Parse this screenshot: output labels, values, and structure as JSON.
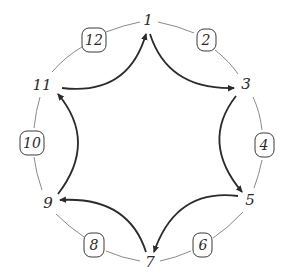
{
  "diagram": {
    "title": "",
    "colors": {
      "circle": "#8a8a8a",
      "arrow": "#2b2b2b",
      "text": "#2a2a2a"
    },
    "odd_nodes": [
      {
        "id": "1",
        "label": "1",
        "x": 148,
        "y": 20
      },
      {
        "id": "3",
        "label": "3",
        "x": 246,
        "y": 84
      },
      {
        "id": "5",
        "label": "5",
        "x": 250,
        "y": 200
      },
      {
        "id": "7",
        "label": "7",
        "x": 150,
        "y": 262
      },
      {
        "id": "9",
        "label": "9",
        "x": 48,
        "y": 203
      },
      {
        "id": "11",
        "label": "11",
        "x": 42,
        "y": 85
      }
    ],
    "boxed_nodes": [
      {
        "id": "2",
        "label": "2",
        "x": 206,
        "y": 40
      },
      {
        "id": "4",
        "label": "4",
        "x": 264,
        "y": 145
      },
      {
        "id": "6",
        "label": "6",
        "x": 203,
        "y": 245
      },
      {
        "id": "8",
        "label": "8",
        "x": 94,
        "y": 245
      },
      {
        "id": "10",
        "label": "10",
        "x": 32,
        "y": 143
      },
      {
        "id": "12",
        "label": "12",
        "x": 94,
        "y": 40
      }
    ],
    "arrows": [
      {
        "from": "11",
        "to": "1"
      },
      {
        "from": "1",
        "to": "3"
      },
      {
        "from": "3",
        "to": "5"
      },
      {
        "from": "5",
        "to": "7"
      },
      {
        "from": "7",
        "to": "9"
      },
      {
        "from": "9",
        "to": "11"
      }
    ]
  }
}
